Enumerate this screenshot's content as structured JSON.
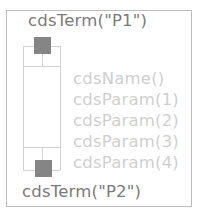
{
  "symbol": {
    "terminals": [
      {
        "label": "cdsTerm(\"P1\")",
        "position": "top"
      },
      {
        "label": "cdsTerm(\"P2\")",
        "position": "bottom"
      }
    ],
    "labels": {
      "name": "cdsName()",
      "params": [
        "cdsParam(1)",
        "cdsParam(2)",
        "cdsParam(3)",
        "cdsParam(4)"
      ]
    },
    "colors": {
      "terminal_text": "#7a7a7a",
      "param_text": "#cfcfcf",
      "pin_fill": "#858585",
      "outline": "#cfcfcf"
    }
  }
}
